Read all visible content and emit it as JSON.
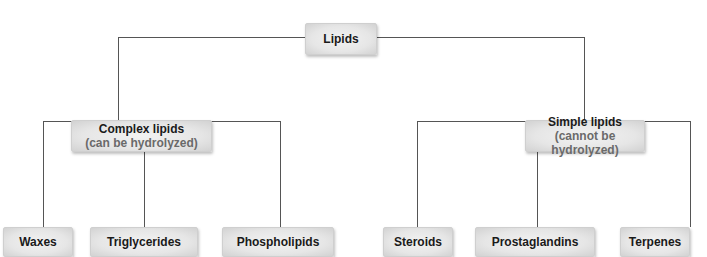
{
  "diagram": {
    "root": {
      "label": "Lipids"
    },
    "left": {
      "label": "Complex lipids",
      "sub": "(can be hydrolyzed)"
    },
    "right": {
      "label": "Simple lipids",
      "sub": "(cannot be hydrolyzed)"
    },
    "leaves": [
      {
        "label": "Waxes"
      },
      {
        "label": "Triglycerides"
      },
      {
        "label": "Phospholipids"
      },
      {
        "label": "Steroids"
      },
      {
        "label": "Prostaglandins"
      },
      {
        "label": "Terpenes"
      }
    ]
  }
}
